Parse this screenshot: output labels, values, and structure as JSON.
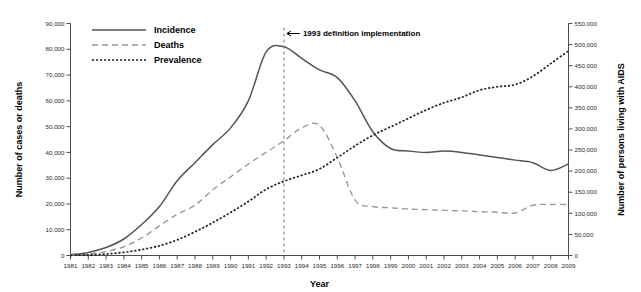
{
  "chart_data": {
    "type": "line",
    "title": "",
    "xlabel": "Year",
    "ylabel": "Number of cases or deaths",
    "y2label": "Number of persons living with AIDS",
    "grid": false,
    "legend_position": "top-left",
    "xlim": [
      1981,
      2009
    ],
    "ylim": [
      0,
      90000
    ],
    "y2lim": [
      0,
      550000
    ],
    "x": [
      1981,
      1982,
      1983,
      1984,
      1985,
      1986,
      1987,
      1988,
      1989,
      1990,
      1991,
      1992,
      1993,
      1994,
      1995,
      1996,
      1997,
      1998,
      1999,
      2000,
      2001,
      2002,
      2003,
      2004,
      2005,
      2006,
      2007,
      2008,
      2009
    ],
    "xticklabels": [
      "1981",
      "1982",
      "1983",
      "1984",
      "1985",
      "1986",
      "1987",
      "1988",
      "1989",
      "1990",
      "1991",
      "1992",
      "1993",
      "1994",
      "1995",
      "1996",
      "1997",
      "1998",
      "1999",
      "2000",
      "2001",
      "2002",
      "2003",
      "2004",
      "2005",
      "2006",
      "2007",
      "2008",
      "2009"
    ],
    "yticks": [
      0,
      10000,
      20000,
      30000,
      40000,
      50000,
      60000,
      70000,
      80000,
      90000
    ],
    "yticklabels": [
      "0",
      "10,000",
      "20,000",
      "30,000",
      "40,000",
      "50,000",
      "60,000",
      "70,000",
      "80,000",
      "90,000"
    ],
    "y2ticks": [
      0,
      50000,
      100000,
      150000,
      200000,
      250000,
      300000,
      350000,
      400000,
      450000,
      500000,
      550000
    ],
    "y2ticklabels": [
      "0",
      "50,000",
      "100,000",
      "150,000",
      "200,000",
      "250,000",
      "300,000",
      "350,000",
      "400,000",
      "450,000",
      "500,000",
      "550,000"
    ],
    "series": [
      {
        "name": "Incidence",
        "axis": "left",
        "style": "solid",
        "color": "#555555",
        "values": [
          300,
          1200,
          3100,
          6400,
          12000,
          19000,
          29000,
          36000,
          43000,
          49500,
          60000,
          79000,
          81000,
          76500,
          72000,
          69000,
          60000,
          48000,
          41500,
          40500,
          40000,
          40500,
          40000,
          39000,
          38000,
          37000,
          36000,
          33000,
          35500
        ]
      },
      {
        "name": "Deaths",
        "axis": "left",
        "style": "dashed",
        "color": "#9a9a9a",
        "values": [
          150,
          500,
          1500,
          3400,
          6800,
          11500,
          16000,
          19500,
          25500,
          30500,
          35500,
          40000,
          44500,
          49500,
          50500,
          38000,
          21500,
          19000,
          18500,
          18000,
          17800,
          17500,
          17300,
          17000,
          16800,
          16500,
          19500,
          19800,
          19800
        ]
      },
      {
        "name": "Prevalence",
        "axis": "right",
        "style": "dotted",
        "color": "#222222",
        "values": [
          400,
          1400,
          3500,
          7500,
          14000,
          23000,
          37000,
          56000,
          78000,
          102000,
          128000,
          157000,
          176000,
          190000,
          205000,
          232000,
          260000,
          285000,
          305000,
          325000,
          345000,
          362000,
          375000,
          392000,
          400000,
          405000,
          425000,
          455000,
          485000
        ]
      }
    ],
    "annotations": [
      {
        "name": "definition-change",
        "text": "1993 definition implementation",
        "x": 1993,
        "arrow": "left"
      }
    ]
  }
}
